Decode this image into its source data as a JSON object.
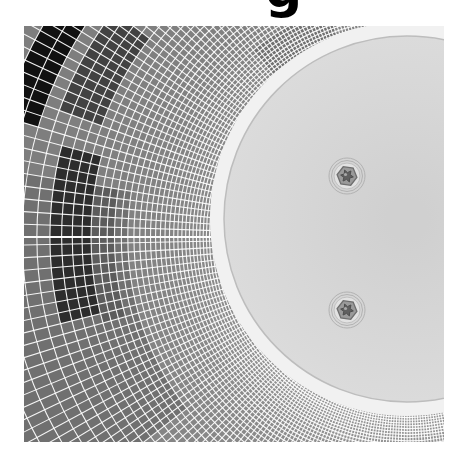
{
  "page": {
    "background": "#ffffff"
  },
  "title_fragment": {
    "text": "g",
    "color": "#000000",
    "note": "bottom of a bold title glyph clipped by the top edge of the screenshot"
  },
  "figure": {
    "image_rect": {
      "left": 24,
      "top": 26,
      "width": 420,
      "height": 416
    },
    "mesh": {
      "center": {
        "x": 383,
        "y": 211
      },
      "r_start": 178,
      "r_max": 472,
      "ring_w0": 2.6,
      "ring_k": 0.009,
      "spoke_dphi0": 1.9,
      "spoke_sin_gain": 1.3,
      "line_color": "rgba(255,255,255,0.92)",
      "line_width": 1.1,
      "base_gray": 126,
      "near_disc_boost": 16,
      "near_disc_decay": 55,
      "bottom_light_gain": 9,
      "seam": {
        "angle_deg": 180,
        "width": 2.2
      },
      "patches": [
        {
          "name": "left-shadow",
          "phi0": 142,
          "phi1": 190,
          "r0": 278,
          "r1": 472,
          "gray": 112
        },
        {
          "name": "top-disc-swath",
          "phi0": -129,
          "phi1": -109,
          "r0": 178,
          "r1": 240,
          "gray": 112
        },
        {
          "name": "upper-left-streak",
          "phi0": -160,
          "phi1": -143,
          "r0": 322,
          "r1": 368,
          "gray": 66
        },
        {
          "name": "left-inner-dark-column",
          "phi0": 165,
          "phi1": 189,
          "r0": 290,
          "r1": 316,
          "gray": 92
        },
        {
          "name": "left-dark-column",
          "phi0": 166,
          "phi1": 195,
          "r0": 318,
          "r1": 352,
          "gray": 45
        },
        {
          "name": "black-arc-band",
          "phi0": -164,
          "phi1": -137,
          "r0": 384,
          "r1": 428,
          "gray": 17
        }
      ]
    },
    "disc": {
      "cx": 383,
      "cy": 193,
      "r": 183,
      "halo_r": 197,
      "halo_color": "#f1f1f1",
      "fill_center": "#d0d0d0",
      "fill_edge": "#dbdbdb",
      "edge_color": "#bdbdbd",
      "edge_width": 1.5
    },
    "bolts": {
      "positions": [
        {
          "x": 323,
          "y": 150
        },
        {
          "x": 323,
          "y": 284
        }
      ],
      "outer_ring_r": 18,
      "outer_ring2_r": 15.5,
      "ring_color": "#b2b2b2",
      "washer_r": 13,
      "washer_fill": "#e2e2e2",
      "washer_edge": "#c0c0c0",
      "hex_r": 10,
      "hex_fill": "#9a9a9a",
      "hex_edge": "#6e6e6e",
      "hex_rotation_deg": 8,
      "socket_r": 6.4,
      "socket_inner_r": 3.4,
      "socket_fill": "#606060",
      "socket_edge": "#4e4e4e",
      "glint_r": 1.6,
      "glint_color": "#a8a8a8"
    }
  }
}
